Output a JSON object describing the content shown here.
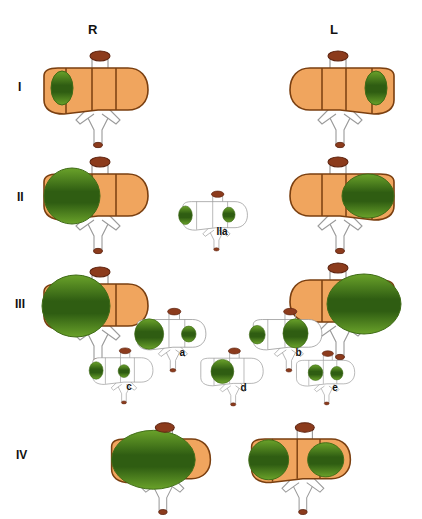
{
  "figure": {
    "background": "#ffffff",
    "width": 422,
    "height": 506
  },
  "colors": {
    "liver_fill": "#f0a55e",
    "liver_stroke": "#7a3f10",
    "liver_segment_line": "#7a3f10",
    "lesion_green_light": "#6aa22a",
    "lesion_green_dark": "#2f5d12",
    "lesion_stroke": "#3f6b16",
    "gallbladder_fill": "#8c3b1c",
    "gallbladder_stroke": "#5e2410",
    "vessel_stroke": "#9a9a9a",
    "vessel_fill": "#ffffff",
    "outline_only_fill": "#ffffff",
    "outline_only_stroke": "#8f8f8f",
    "label_text": "#111111"
  },
  "columns": [
    {
      "key": "R",
      "label": "R",
      "x": 88,
      "y": 22
    },
    {
      "key": "L",
      "label": "L",
      "x": 330,
      "y": 22
    }
  ],
  "rows": [
    {
      "key": "I",
      "label": "I",
      "x": 18,
      "y": 80
    },
    {
      "key": "II",
      "label": "II",
      "x": 17,
      "y": 190
    },
    {
      "key": "III",
      "label": "III",
      "x": 15,
      "y": 297
    },
    {
      "key": "IV",
      "label": "IV",
      "x": 16,
      "y": 448
    }
  ],
  "units": [
    {
      "name": "liver-I-R",
      "row": "I",
      "side": "R",
      "x": 36,
      "y": 46,
      "scale": 1.0,
      "mirrored": false,
      "style": "filled",
      "lesions": [
        {
          "name": "lesion-right-lobe-small",
          "cx": 26,
          "cy": 42,
          "rx": 11,
          "ry": 17
        }
      ]
    },
    {
      "name": "liver-I-L",
      "row": "I",
      "side": "L",
      "x": 282,
      "y": 46,
      "scale": 1.0,
      "mirrored": true,
      "style": "filled",
      "lesions": [
        {
          "name": "lesion-left-lobe-small",
          "cx": 26,
          "cy": 42,
          "rx": 11,
          "ry": 17
        }
      ]
    },
    {
      "name": "liver-II-R",
      "row": "II",
      "side": "R",
      "x": 36,
      "y": 152,
      "scale": 1.0,
      "mirrored": false,
      "style": "filled",
      "lesions": [
        {
          "name": "lesion-right-lobe-large",
          "cx": 36,
          "cy": 44,
          "rx": 28,
          "ry": 28
        }
      ]
    },
    {
      "name": "liver-II-L",
      "row": "II",
      "side": "L",
      "x": 282,
      "y": 152,
      "scale": 1.0,
      "mirrored": true,
      "style": "filled",
      "lesions": [
        {
          "name": "lesion-left-lobe-large",
          "cx": 34,
          "cy": 44,
          "rx": 26,
          "ry": 22
        }
      ]
    },
    {
      "name": "liver-IIa",
      "row": "II",
      "side": "center",
      "sub": "IIa",
      "x": 178,
      "y": 188,
      "scale": 0.62,
      "mirrored": false,
      "style": "outline",
      "label": {
        "text": "IIa",
        "x": 62,
        "y": 62
      },
      "lesions": [
        {
          "name": "lesion-left-edge",
          "cx": 12,
          "cy": 44,
          "rx": 11,
          "ry": 15
        },
        {
          "name": "lesion-right-edge",
          "cx": 82,
          "cy": 43,
          "rx": 10,
          "ry": 12
        }
      ]
    },
    {
      "name": "liver-III-R",
      "row": "III",
      "side": "R",
      "x": 36,
      "y": 262,
      "scale": 1.0,
      "mirrored": false,
      "style": "filled",
      "lesions": [
        {
          "name": "lesion-right-lobe-xlarge",
          "cx": 40,
          "cy": 44,
          "rx": 34,
          "ry": 31
        }
      ]
    },
    {
      "name": "liver-III-L",
      "row": "III",
      "side": "L",
      "x": 282,
      "y": 258,
      "scale": 1.0,
      "mirrored": true,
      "style": "filled",
      "lesions": [
        {
          "name": "lesion-left-lobe-xlarge",
          "cx": 38,
          "cy": 46,
          "rx": 37,
          "ry": 30
        }
      ]
    },
    {
      "name": "liver-III-a",
      "row": "III",
      "sub": "a",
      "x": 132,
      "y": 305,
      "scale": 0.66,
      "mirrored": false,
      "style": "outline",
      "label": {
        "text": "a",
        "x": 72,
        "y": 63
      },
      "lesions": [
        {
          "name": "lesion-large-left",
          "cx": 26,
          "cy": 44,
          "rx": 22,
          "ry": 23
        },
        {
          "name": "lesion-small-right",
          "cx": 86,
          "cy": 44,
          "rx": 11,
          "ry": 12
        }
      ]
    },
    {
      "name": "liver-III-b",
      "row": "III",
      "sub": "b",
      "x": 248,
      "y": 305,
      "scale": 0.66,
      "mirrored": false,
      "style": "outline",
      "label": {
        "text": "b",
        "x": 72,
        "y": 63
      },
      "lesions": [
        {
          "name": "lesion-small-left",
          "cx": 14,
          "cy": 45,
          "rx": 12,
          "ry": 14
        },
        {
          "name": "lesion-large-right",
          "cx": 72,
          "cy": 43,
          "rx": 19,
          "ry": 22
        }
      ]
    },
    {
      "name": "liver-III-c",
      "row": "III",
      "sub": "c",
      "x": 88,
      "y": 345,
      "scale": 0.58,
      "mirrored": false,
      "style": "outline",
      "label": {
        "text": "c",
        "x": 66,
        "y": 62
      },
      "lesions": [
        {
          "name": "lesion-medium-left",
          "cx": 14,
          "cy": 44,
          "rx": 12,
          "ry": 15
        },
        {
          "name": "lesion-small-center",
          "cx": 62,
          "cy": 45,
          "rx": 10,
          "ry": 11
        }
      ]
    },
    {
      "name": "liver-III-d",
      "row": "III",
      "sub": "d",
      "x": 196,
      "y": 345,
      "scale": 0.6,
      "mirrored": false,
      "style": "outline",
      "label": {
        "text": "d",
        "x": 74,
        "y": 62
      },
      "lesions": [
        {
          "name": "lesion-large-center",
          "cx": 44,
          "cy": 44,
          "rx": 19,
          "ry": 20
        }
      ]
    },
    {
      "name": "liver-III-e",
      "row": "III",
      "sub": "e",
      "x": 292,
      "y": 348,
      "scale": 0.56,
      "mirrored": false,
      "style": "outline",
      "label": {
        "text": "e",
        "x": 72,
        "y": 60
      },
      "lesions": [
        {
          "name": "lesion-center",
          "cx": 42,
          "cy": 44,
          "rx": 13,
          "ry": 14
        },
        {
          "name": "lesion-right",
          "cx": 80,
          "cy": 45,
          "rx": 11,
          "ry": 12
        }
      ]
    },
    {
      "name": "liver-IV-left",
      "row": "IV",
      "side": "center-left",
      "x": 104,
      "y": 418,
      "scale": 0.95,
      "mirrored": false,
      "style": "filled",
      "lesions": [
        {
          "name": "lesion-bilobar-giant",
          "cx": 52,
          "cy": 44,
          "rx": 44,
          "ry": 31
        }
      ]
    },
    {
      "name": "liver-IV-right",
      "row": "IV",
      "side": "center-right",
      "x": 244,
      "y": 418,
      "scale": 0.95,
      "mirrored": false,
      "style": "filled",
      "lesions": [
        {
          "name": "lesion-bilobar-left",
          "cx": 26,
          "cy": 44,
          "rx": 21,
          "ry": 21
        },
        {
          "name": "lesion-bilobar-right",
          "cx": 86,
          "cy": 44,
          "rx": 19,
          "ry": 18
        }
      ]
    }
  ]
}
